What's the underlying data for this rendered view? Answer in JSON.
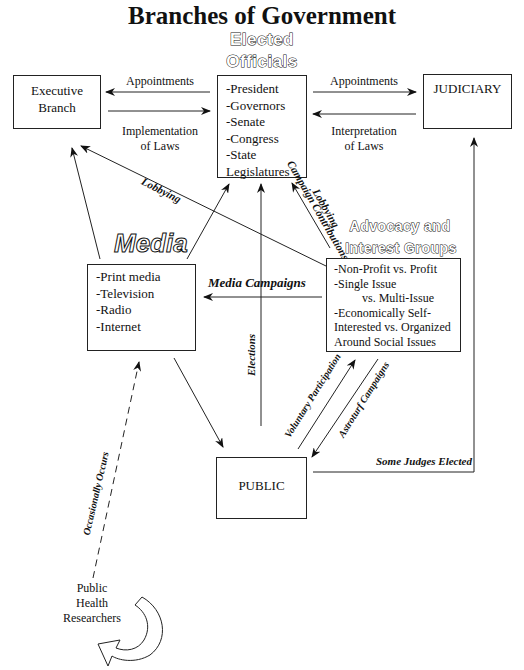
{
  "title": "Branches of Government",
  "nodes": {
    "elected_officials": {
      "heading_line1": "Elected",
      "heading_line2": "Officials",
      "items": [
        "-President",
        "-Governors",
        "-Senate",
        "-Congress",
        "-State",
        "Legislatures"
      ]
    },
    "executive": {
      "line1": "Executive",
      "line2": "Branch"
    },
    "judiciary": {
      "label": "JUDICIARY"
    },
    "media": {
      "heading": "Media",
      "items": [
        "-Print media",
        "-Television",
        "-Radio",
        "-Internet"
      ]
    },
    "advocacy": {
      "heading_line1": "Advocacy and",
      "heading_line2": "Interest Groups",
      "items": [
        "-Non-Profit vs. Profit",
        "-Single Issue",
        "vs. Multi-Issue",
        "-Economically Self-",
        "Interested vs. Organized",
        "Around Social Issues"
      ]
    },
    "public": {
      "label": "PUBLIC"
    },
    "researchers": {
      "line1": "Public",
      "line2": "Health",
      "line3": "Researchers"
    }
  },
  "edges": {
    "officials_to_executive": "Appointments",
    "executive_to_officials": {
      "line1": "Implementation",
      "line2": "of Laws"
    },
    "officials_to_judiciary": "Appointments",
    "judiciary_to_officials": {
      "line1": "Interpretation",
      "line2": "of Laws"
    },
    "advocacy_to_executive": "Lobbying",
    "advocacy_to_officials_contrib": "Campaign Contributions",
    "advocacy_to_officials_lobby": "Lobbying",
    "advocacy_to_media": "Media Campaigns",
    "public_to_officials": "Elections",
    "public_to_advocacy": "Voluntary Participation",
    "advocacy_to_public": "Astroturf Campaigns",
    "public_to_judiciary": "Some Judges Elected",
    "researchers_to_media": "Occasionally Occurs"
  },
  "colors": {
    "line": "#222222",
    "background": "#ffffff"
  }
}
